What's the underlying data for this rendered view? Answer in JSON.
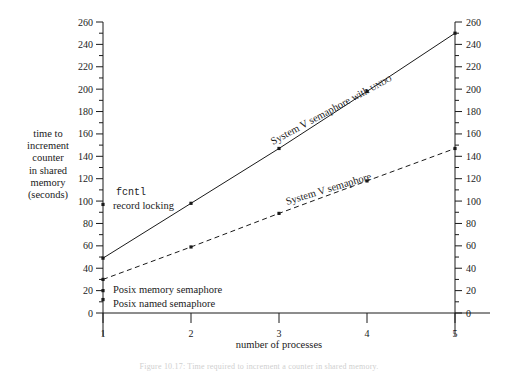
{
  "chart_data": {
    "type": "line",
    "title": "",
    "xlabel": "number of processes",
    "ylabel": "time to increment counter in shared memory (seconds)",
    "x": [
      1,
      2,
      3,
      4,
      5
    ],
    "xlim": [
      1,
      5
    ],
    "ylim": [
      0,
      260
    ],
    "xticks": [
      "1",
      "2",
      "3",
      "4",
      "5"
    ],
    "yticks": [
      "0",
      "20",
      "40",
      "60",
      "80",
      "100",
      "120",
      "140",
      "160",
      "180",
      "200",
      "220",
      "240",
      "260"
    ],
    "ytick_step": 20,
    "yminor_step": 10,
    "grid": false,
    "legend_position": "inline-annotations",
    "dual_y_axis": true,
    "series": [
      {
        "name": "System V semaphore with UNDO",
        "style": "solid",
        "values": [
          49,
          98,
          147,
          198,
          250
        ],
        "markers": true
      },
      {
        "name": "System V semaphore",
        "style": "dashed",
        "values": [
          30,
          59,
          89,
          118,
          147
        ],
        "markers": true
      },
      {
        "name": "fcntl record locking",
        "style": "point-only",
        "values": [
          97,
          null,
          null,
          null,
          null
        ],
        "markers": true
      },
      {
        "name": "Posix memory semaphore",
        "style": "point-only",
        "values": [
          20,
          null,
          null,
          null,
          null
        ],
        "markers": true
      },
      {
        "name": "Posix named semaphore",
        "style": "point-only",
        "values": [
          12,
          null,
          null,
          null,
          null
        ],
        "markers": true
      }
    ],
    "annotations": [
      {
        "id": "fcntl",
        "text_mono": "fcntl",
        "text": "record locking",
        "x": 1,
        "y": 97
      },
      {
        "id": "posix-memory",
        "text": "Posix memory semaphore",
        "x": 1,
        "y": 20
      },
      {
        "id": "posix-named",
        "text": "Posix named semaphore",
        "x": 1,
        "y": 12
      },
      {
        "id": "sysv-undo",
        "text_main": "System V semaphore with ",
        "text_small": "UNDO"
      },
      {
        "id": "sysv",
        "text_main": "System V semaphore"
      }
    ]
  },
  "axis": {
    "ylabel_lines": [
      "time to",
      "increment",
      "counter",
      "in shared",
      "memory",
      "(seconds)"
    ],
    "xlabel": "number of processes"
  },
  "caption": {
    "text": "Figure 10.17: Time required to increment a counter in shared memory."
  },
  "colors": {
    "ink": "#1a1a1a",
    "background": "#ffffff"
  }
}
